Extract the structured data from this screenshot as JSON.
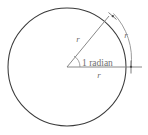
{
  "figure": {
    "name": "radian-definition-diagram",
    "type": "geometry-diagram",
    "background_color": "#ffffff",
    "circle_color": "#3a3a3a",
    "line_color": "#7a7a7a",
    "text_color": "#6f6f6f"
  },
  "geometry": {
    "circle": {
      "center_x": 67,
      "center_y": 67,
      "radius": 59
    },
    "horizontal_radius": {
      "from_x": 67,
      "from_y": 67,
      "to_x": 140,
      "to_y": 67
    },
    "slanted_radius": {
      "from_x": 67,
      "from_y": 67,
      "to_x": 108,
      "to_y": 17,
      "angle_degrees": 57.3
    },
    "measure_arc": {
      "start_x": 113,
      "start_y": 15,
      "end_x": 130,
      "end_y": 67,
      "radius": 66
    },
    "angle_marker_radius": 13
  },
  "labels": {
    "angle": "1 radian",
    "radius_slanted": "r",
    "radius_arc": "r",
    "radius_horizontal": "r"
  }
}
